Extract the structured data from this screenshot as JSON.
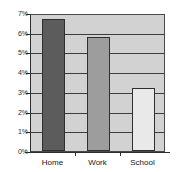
{
  "chart_data": {
    "type": "bar",
    "title": "",
    "xlabel": "",
    "ylabel": "",
    "categories": [
      "Home",
      "Work",
      "School"
    ],
    "values": [
      6.7,
      5.8,
      3.2
    ],
    "value_labels": [
      "6.7%",
      "5.8%",
      "3.2%"
    ],
    "ylim": [
      0,
      7
    ],
    "ytick_labels": [
      "0%",
      "1%",
      "2%",
      "3%",
      "4%",
      "5%",
      "6%",
      "7%"
    ],
    "ytick_values": [
      0,
      1,
      2,
      3,
      4,
      5,
      6,
      7
    ],
    "grid": true,
    "legend": "none",
    "bar_colors": [
      "#5c5c5c",
      "#9d9d9d",
      "#e9e9e9"
    ],
    "plot_background": "#d2d2d2",
    "frame_color": "#4a4a4a",
    "gridline_color": "#3d3d3d"
  },
  "figure": {
    "background": "#ffffff"
  }
}
